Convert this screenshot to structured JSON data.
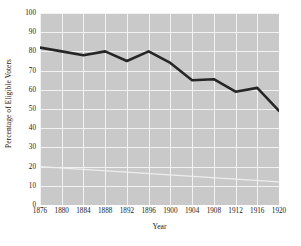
{
  "chart_data": {
    "type": "line",
    "title": "",
    "xlabel": "Year",
    "ylabel": "Percentage of Eligible Voters",
    "x": [
      1876,
      1880,
      1884,
      1888,
      1892,
      1896,
      1900,
      1904,
      1908,
      1912,
      1916,
      1920
    ],
    "categories": [
      "1876",
      "1880",
      "1884",
      "1888",
      "1892",
      "1896",
      "1900",
      "1904",
      "1908",
      "1912",
      "1916",
      "1920"
    ],
    "values": [
      82,
      80,
      78,
      80,
      75,
      80,
      74,
      65,
      65.5,
      59,
      61,
      49
    ],
    "series": [
      {
        "name": "Percentage of Eligible Voters",
        "values": [
          82,
          80,
          78,
          80,
          75,
          80,
          74,
          65,
          65.5,
          59,
          61,
          49
        ],
        "color": "#262626",
        "line_width": 2.6
      }
    ],
    "xlim": [
      1876,
      1920
    ],
    "ylim": [
      0,
      100
    ],
    "ytick_labels": [
      "0",
      "10",
      "20",
      "30",
      "40",
      "50",
      "60",
      "70",
      "80",
      "90",
      "100"
    ],
    "ytick_values": [
      0,
      10,
      20,
      30,
      40,
      50,
      60,
      70,
      80,
      90,
      100
    ],
    "xtick_labels": [
      "1876",
      "1880",
      "1884",
      "1888",
      "1892",
      "1896",
      "1900",
      "1904",
      "1908",
      "1912",
      "1916",
      "1920"
    ],
    "grid": true,
    "grid_color": "#f2f2f2",
    "panel_color": "#c9c9c9",
    "figure_color": "#ffffff",
    "legend": null,
    "legend_position": "none",
    "annotations": [],
    "artifact_line": {
      "name": "faint-diagonal-artifact",
      "color": "#eeeeee",
      "start": [
        1876,
        20
      ],
      "end": [
        1920,
        12
      ]
    }
  }
}
